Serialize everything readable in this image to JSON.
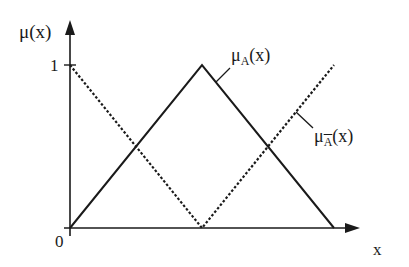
{
  "diagram": {
    "type": "fuzzy-membership-functions",
    "y_axis_label": "μ(x)",
    "x_axis_label": "x",
    "origin_label": "0",
    "y_tick_label": "1",
    "curves": [
      {
        "name": "mu_A",
        "label_main": "μ",
        "label_sub": "A",
        "label_tail": "(x)",
        "style": "solid",
        "shape": "triangle",
        "points": [
          [
            0,
            0
          ],
          [
            0.5,
            1
          ],
          [
            1,
            0
          ]
        ]
      },
      {
        "name": "mu_A_complement",
        "label_main": "μ",
        "label_sub": "A",
        "label_tail": "(x)",
        "style": "dashed",
        "shape": "inverted-triangle",
        "points": [
          [
            0,
            1
          ],
          [
            0.5,
            0
          ],
          [
            1,
            1
          ]
        ]
      }
    ],
    "colors": {
      "line": "#1a1a1a",
      "background": "#ffffff"
    }
  }
}
